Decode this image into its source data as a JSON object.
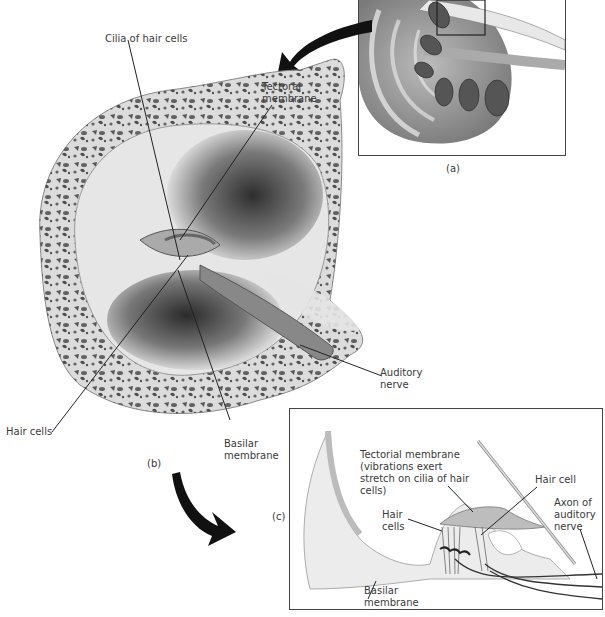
{
  "figure": {
    "panels": {
      "a": {
        "label": "(a)"
      },
      "b": {
        "label": "(b)"
      },
      "c": {
        "label": "(c)"
      }
    },
    "labels_b": {
      "cilia": "Cilia of hair cells",
      "tectoral": "Tectoral membrane",
      "auditory_nerve": "Auditory nerve",
      "hair_cells": "Hair cells",
      "basilar": "Basilar membrane"
    },
    "labels_c": {
      "tectorial": "Tectorial membrane (vibrations exert stretch on cilia of hair cells)",
      "hair_cell": "Hair cell",
      "hair_cells": "Hair cells",
      "axon": "Axon of auditory nerve",
      "basilar": "Basilar membrane"
    },
    "colors": {
      "bone": "#d9d9d9",
      "bone_spots": "#4a4a4a",
      "chamber_dark": "#3c3c3c",
      "outline": "#444444"
    }
  }
}
